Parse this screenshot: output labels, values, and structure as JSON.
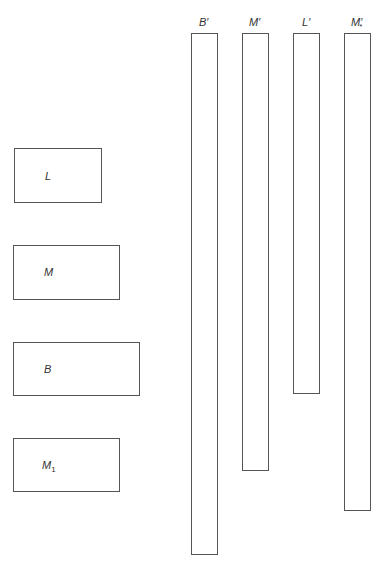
{
  "diagram": {
    "type": "block-size comparison",
    "left_boxes": [
      {
        "id": "L",
        "label": "L",
        "sub": "",
        "x": 14,
        "y": 148,
        "w": 88,
        "h": 55
      },
      {
        "id": "M",
        "label": "M",
        "sub": "",
        "x": 13,
        "y": 245,
        "w": 107,
        "h": 55
      },
      {
        "id": "B",
        "label": "B",
        "sub": "",
        "x": 13,
        "y": 342,
        "w": 127,
        "h": 54
      },
      {
        "id": "M1",
        "label": "M",
        "sub": "1",
        "x": 13,
        "y": 438,
        "w": 107,
        "h": 54
      }
    ],
    "bars": [
      {
        "id": "B-prime",
        "label": "B",
        "mark": "′",
        "x": 191,
        "y": 33,
        "w": 27,
        "h": 522
      },
      {
        "id": "M-prime",
        "label": "M",
        "mark": "′",
        "x": 242,
        "y": 33,
        "w": 27,
        "h": 438
      },
      {
        "id": "L-prime",
        "label": "L",
        "mark": "′",
        "x": 293,
        "y": 33,
        "w": 27,
        "h": 361
      },
      {
        "id": "M-prime-star",
        "label": "M",
        "mark": "′",
        "sub": "*",
        "x": 344,
        "y": 33,
        "w": 27,
        "h": 478
      }
    ]
  }
}
